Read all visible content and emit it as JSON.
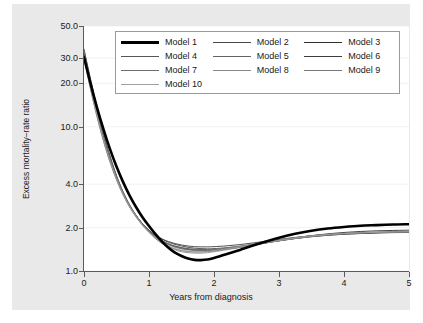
{
  "chart_data": {
    "type": "line",
    "title": "",
    "xlabel": "Years from diagnosis",
    "ylabel": "Excess mortality–rate ratio",
    "xlim": [
      0,
      5
    ],
    "ylim": [
      1.0,
      50.0
    ],
    "yscale": "log",
    "grid": true,
    "legend_position": "top-center-inside",
    "xticks": [
      {
        "value": 0,
        "label": "0"
      },
      {
        "value": 1,
        "label": "1"
      },
      {
        "value": 2,
        "label": "2"
      },
      {
        "value": 3,
        "label": "3"
      },
      {
        "value": 4,
        "label": "4"
      },
      {
        "value": 5,
        "label": "5"
      }
    ],
    "yticks": [
      {
        "value": 1.0,
        "label": "1.0"
      },
      {
        "value": 2.0,
        "label": "2.0"
      },
      {
        "value": 4.0,
        "label": "4.0"
      },
      {
        "value": 10.0,
        "label": "10.0"
      },
      {
        "value": 20.0,
        "label": "20.0"
      },
      {
        "value": 30.0,
        "label": "30.0"
      },
      {
        "value": 50.0,
        "label": "50.0"
      }
    ],
    "x": [
      0,
      0.1,
      0.2,
      0.3,
      0.4,
      0.5,
      0.6,
      0.7,
      0.8,
      0.9,
      1.0,
      1.1,
      1.2,
      1.3,
      1.4,
      1.5,
      1.6,
      1.7,
      1.8,
      1.9,
      2.0,
      2.2,
      2.4,
      2.6,
      2.8,
      3.0,
      3.25,
      3.5,
      3.75,
      4.0,
      4.25,
      4.5,
      4.75,
      5.0
    ],
    "series": [
      {
        "name": "Model 1",
        "color": "#000000",
        "width": 2.6,
        "values": [
          30.5,
          20.0,
          13.6,
          9.6,
          7.0,
          5.3,
          4.15,
          3.35,
          2.78,
          2.36,
          2.05,
          1.8,
          1.6,
          1.45,
          1.34,
          1.27,
          1.22,
          1.195,
          1.19,
          1.2,
          1.23,
          1.31,
          1.4,
          1.5,
          1.6,
          1.7,
          1.81,
          1.9,
          1.97,
          2.02,
          2.06,
          2.08,
          2.1,
          2.11
        ]
      },
      {
        "name": "Model 2",
        "color": "#4a4a4a",
        "width": 0.9,
        "values": [
          33.5,
          20.5,
          13.0,
          8.7,
          6.1,
          4.5,
          3.5,
          2.85,
          2.42,
          2.12,
          1.91,
          1.76,
          1.66,
          1.58,
          1.53,
          1.49,
          1.46,
          1.44,
          1.43,
          1.425,
          1.43,
          1.45,
          1.48,
          1.52,
          1.57,
          1.62,
          1.68,
          1.73,
          1.77,
          1.8,
          1.82,
          1.835,
          1.845,
          1.85
        ]
      },
      {
        "name": "Model 3",
        "color": "#2e2e2e",
        "width": 0.9,
        "values": [
          34.5,
          21.5,
          13.6,
          9.0,
          6.3,
          4.6,
          3.55,
          2.88,
          2.43,
          2.12,
          1.9,
          1.74,
          1.62,
          1.54,
          1.48,
          1.44,
          1.41,
          1.395,
          1.385,
          1.385,
          1.39,
          1.42,
          1.46,
          1.51,
          1.57,
          1.63,
          1.7,
          1.76,
          1.81,
          1.85,
          1.88,
          1.9,
          1.91,
          1.92
        ]
      },
      {
        "name": "Model 4",
        "color": "#555555",
        "width": 0.9,
        "values": [
          32.0,
          19.8,
          12.7,
          8.5,
          6.0,
          4.45,
          3.48,
          2.84,
          2.41,
          2.11,
          1.89,
          1.73,
          1.62,
          1.54,
          1.49,
          1.455,
          1.43,
          1.415,
          1.41,
          1.41,
          1.415,
          1.44,
          1.47,
          1.52,
          1.57,
          1.62,
          1.68,
          1.73,
          1.77,
          1.8,
          1.82,
          1.84,
          1.85,
          1.86
        ]
      },
      {
        "name": "Model 5",
        "color": "#636363",
        "width": 0.9,
        "values": [
          31.5,
          19.3,
          12.3,
          8.3,
          5.9,
          4.4,
          3.45,
          2.82,
          2.4,
          2.1,
          1.88,
          1.72,
          1.61,
          1.53,
          1.475,
          1.44,
          1.415,
          1.4,
          1.395,
          1.395,
          1.4,
          1.43,
          1.465,
          1.51,
          1.565,
          1.62,
          1.68,
          1.74,
          1.78,
          1.81,
          1.83,
          1.845,
          1.855,
          1.86
        ]
      },
      {
        "name": "Model 6",
        "color": "#3d3d3d",
        "width": 0.9,
        "values": [
          33.0,
          20.2,
          12.9,
          8.6,
          6.05,
          4.48,
          3.5,
          2.86,
          2.43,
          2.13,
          1.92,
          1.77,
          1.67,
          1.6,
          1.55,
          1.515,
          1.49,
          1.475,
          1.47,
          1.47,
          1.475,
          1.495,
          1.525,
          1.565,
          1.61,
          1.655,
          1.71,
          1.755,
          1.79,
          1.815,
          1.835,
          1.845,
          1.855,
          1.86
        ]
      },
      {
        "name": "Model 7",
        "color": "#6e6e6e",
        "width": 0.9,
        "values": [
          30.0,
          18.5,
          11.9,
          8.05,
          5.75,
          4.32,
          3.4,
          2.79,
          2.38,
          2.08,
          1.86,
          1.69,
          1.565,
          1.48,
          1.42,
          1.385,
          1.365,
          1.355,
          1.355,
          1.365,
          1.38,
          1.42,
          1.465,
          1.515,
          1.57,
          1.625,
          1.69,
          1.745,
          1.785,
          1.815,
          1.84,
          1.855,
          1.865,
          1.87
        ]
      },
      {
        "name": "Model 8",
        "color": "#8a8a8a",
        "width": 0.9,
        "values": [
          29.5,
          18.2,
          11.7,
          7.9,
          5.68,
          4.28,
          3.38,
          2.78,
          2.37,
          2.07,
          1.85,
          1.675,
          1.55,
          1.46,
          1.4,
          1.36,
          1.34,
          1.33,
          1.33,
          1.34,
          1.36,
          1.405,
          1.455,
          1.51,
          1.565,
          1.62,
          1.685,
          1.74,
          1.785,
          1.82,
          1.84,
          1.855,
          1.865,
          1.87
        ]
      },
      {
        "name": "Model 9",
        "color": "#787878",
        "width": 0.9,
        "values": [
          34.0,
          20.8,
          13.2,
          8.8,
          6.15,
          4.55,
          3.54,
          2.88,
          2.44,
          2.13,
          1.9,
          1.73,
          1.605,
          1.52,
          1.46,
          1.425,
          1.4,
          1.39,
          1.39,
          1.4,
          1.415,
          1.45,
          1.49,
          1.54,
          1.59,
          1.645,
          1.705,
          1.755,
          1.795,
          1.825,
          1.845,
          1.86,
          1.87,
          1.875
        ]
      },
      {
        "name": "Model 10",
        "color": "#a0a0a0",
        "width": 0.9,
        "values": [
          31.0,
          19.0,
          12.2,
          8.2,
          5.85,
          4.38,
          3.44,
          2.82,
          2.4,
          2.09,
          1.87,
          1.7,
          1.58,
          1.49,
          1.43,
          1.395,
          1.37,
          1.36,
          1.36,
          1.37,
          1.385,
          1.425,
          1.47,
          1.52,
          1.575,
          1.63,
          1.695,
          1.75,
          1.79,
          1.82,
          1.84,
          1.855,
          1.865,
          1.87
        ]
      }
    ]
  },
  "legend": {
    "entries": [
      {
        "label": "Model 1"
      },
      {
        "label": "Model 2"
      },
      {
        "label": "Model 3"
      },
      {
        "label": "Model 4"
      },
      {
        "label": "Model 5"
      },
      {
        "label": "Model 6"
      },
      {
        "label": "Model 7"
      },
      {
        "label": "Model 8"
      },
      {
        "label": "Model 9"
      },
      {
        "label": "Model 10"
      }
    ]
  },
  "colors": {
    "panel_background": "#e9e9e9",
    "plot_background": "#ffffff",
    "axis": "#5a5a5a",
    "gridline": "#f2f2f2",
    "text": "#1a1a1a",
    "legend_border": "#9a9a9a"
  }
}
